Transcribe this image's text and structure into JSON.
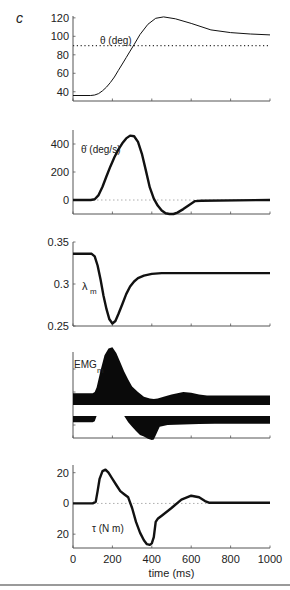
{
  "figure": {
    "panel_letter": "c",
    "xlabel": "time (ms)",
    "x_ticks": [
      0,
      200,
      400,
      600,
      800,
      1000
    ]
  },
  "chart_data": [
    {
      "type": "line",
      "panel": "theta",
      "label": "θ (deg)",
      "ylim": [
        30,
        122
      ],
      "y_ticks": [
        40,
        60,
        80,
        100,
        120
      ],
      "reference_line": {
        "value": 90,
        "style": "dotted"
      },
      "x": [
        0,
        90,
        110,
        130,
        150,
        170,
        190,
        210,
        230,
        250,
        270,
        290,
        310,
        340,
        380,
        420,
        460,
        520,
        600,
        700,
        800,
        900,
        1000
      ],
      "y": [
        36,
        36,
        36.5,
        38,
        41,
        45,
        50,
        56,
        63,
        70,
        77,
        84,
        91,
        102,
        113,
        119.5,
        121,
        119,
        114,
        107,
        104,
        102.5,
        101.5
      ],
      "stroke_width": 1
    },
    {
      "type": "line",
      "panel": "theta_dot",
      "label": "θ̇ (deg/s)",
      "ylim": [
        -100,
        500
      ],
      "y_ticks": [
        0,
        200,
        400
      ],
      "reference_line": {
        "value": 0,
        "style": "dotted"
      },
      "x": [
        0,
        90,
        110,
        130,
        150,
        170,
        190,
        210,
        230,
        250,
        270,
        290,
        310,
        330,
        350,
        370,
        390,
        410,
        430,
        450,
        470,
        490,
        510,
        530,
        560,
        590,
        620,
        650,
        1000
      ],
      "y": [
        0,
        0,
        5,
        35,
        95,
        170,
        240,
        305,
        360,
        405,
        440,
        460,
        455,
        415,
        330,
        210,
        90,
        10,
        -40,
        -75,
        -95,
        -100,
        -100,
        -90,
        -65,
        -35,
        -8,
        -5,
        0
      ],
      "stroke_width": 2.4
    },
    {
      "type": "line",
      "panel": "lambda_m",
      "label": "λ",
      "label_sub": "m",
      "ylim": [
        0.25,
        0.35
      ],
      "y_ticks": [
        0.25,
        0.3,
        0.35
      ],
      "x": [
        0,
        95,
        110,
        125,
        140,
        155,
        170,
        185,
        200,
        215,
        230,
        250,
        270,
        290,
        310,
        330,
        360,
        400,
        450,
        500,
        600,
        800,
        1000
      ],
      "y": [
        0.336,
        0.336,
        0.333,
        0.322,
        0.305,
        0.286,
        0.27,
        0.258,
        0.253,
        0.256,
        0.264,
        0.276,
        0.288,
        0.297,
        0.303,
        0.307,
        0.31,
        0.312,
        0.313,
        0.313,
        0.313,
        0.313,
        0.313
      ],
      "stroke_width": 2.4
    },
    {
      "type": "area",
      "panel": "emg_m",
      "label": "EMG",
      "label_sub": "m",
      "y_ticks": [
        "",
        "",
        ""
      ],
      "series": [
        {
          "name": "agonist (upper band, height above baseline)",
          "x": [
            0,
            100,
            110,
            120,
            140,
            160,
            180,
            200,
            220,
            240,
            260,
            280,
            300,
            330,
            360,
            390,
            410,
            430,
            460,
            500,
            560,
            600,
            640,
            680,
            720,
            1000
          ],
          "y": [
            5,
            5,
            6,
            10,
            25,
            38,
            44,
            45,
            40,
            32,
            24,
            17,
            11,
            6,
            2,
            0.5,
            0,
            0.5,
            2,
            4,
            6,
            5.5,
            4,
            3,
            3,
            3
          ]
        },
        {
          "name": "antagonist (lower band, depth below baseline)",
          "x": [
            0,
            100,
            110,
            120,
            140,
            180,
            260,
            280,
            300,
            320,
            340,
            360,
            380,
            400,
            410,
            420,
            440,
            480,
            560,
            640,
            720,
            1000
          ],
          "y": [
            6,
            6,
            4,
            0,
            0,
            0,
            0,
            6,
            14,
            22,
            29,
            32,
            36,
            38,
            37,
            30,
            14,
            11,
            10,
            9,
            8.5,
            8.5
          ]
        }
      ]
    },
    {
      "type": "line",
      "panel": "tau",
      "label": "τ (N  m)",
      "ylim": [
        -29,
        25
      ],
      "y_ticks": [
        20,
        0,
        -20
      ],
      "y_tick_labels": [
        "20",
        "0",
        "20"
      ],
      "reference_line": {
        "value": 0,
        "style": "dotted"
      },
      "x": [
        0,
        100,
        115,
        125,
        135,
        150,
        165,
        180,
        200,
        220,
        240,
        260,
        280,
        300,
        320,
        340,
        360,
        375,
        390,
        400,
        410,
        420,
        430,
        450,
        500,
        550,
        600,
        640,
        670,
        690,
        1000
      ],
      "y": [
        0,
        0,
        1,
        8,
        16,
        21,
        22,
        20,
        16,
        12,
        8,
        6,
        4,
        -3,
        -12,
        -19,
        -24,
        -26.5,
        -27,
        -26,
        -22,
        -12,
        -10,
        -8,
        -3,
        2.5,
        5,
        4,
        1.5,
        0.5,
        0.5
      ],
      "stroke_width": 2.4
    }
  ]
}
